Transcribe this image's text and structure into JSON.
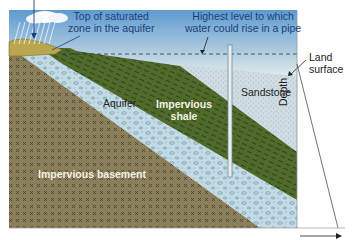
{
  "diagram": {
    "type": "artesian aquifer cross-section",
    "labels": {
      "saturated_zone_line1": "Top of saturated",
      "saturated_zone_line2": "zone in the aquifer",
      "highest_level_line1": "Highest level to which",
      "highest_level_line2": "water could rise in a pipe",
      "land_line1": "Land",
      "land_line2": "surface",
      "sandstone": "Sandstone",
      "depth": "Depth",
      "aquifer": "Aquifer",
      "shale_line1": "Impervious",
      "shale_line2": "shale",
      "basement": "Impervious basement"
    },
    "layers": [
      {
        "name": "Sandstone",
        "color": "#c9d9de"
      },
      {
        "name": "Impervious shale",
        "color": "#4f6a2a"
      },
      {
        "name": "Aquifer",
        "color": "#c3dbe4"
      },
      {
        "name": "Impervious basement",
        "color": "#8a7f5a"
      }
    ],
    "colors": {
      "sky_top": "#5e9ad0",
      "sky_bottom": "#e6eef0",
      "recharge_soil": "#b9a64f",
      "label_blue": "#1b3f7a"
    }
  }
}
